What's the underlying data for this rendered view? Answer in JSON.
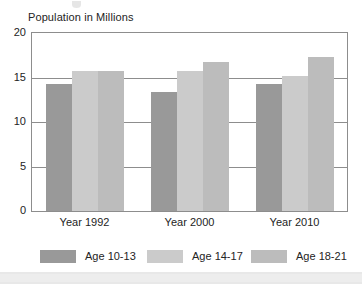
{
  "chart_data": {
    "type": "bar",
    "title": "Population in Millions",
    "xlabel": "",
    "ylabel": "",
    "categories": [
      "Year 1992",
      "Year 2000",
      "Year 2010"
    ],
    "series": [
      {
        "name": "Age 10-13",
        "values": [
          14.3,
          13.4,
          14.3
        ],
        "color": "#999999"
      },
      {
        "name": "Age 14-17",
        "values": [
          15.7,
          15.7,
          15.2
        ],
        "color": "#cbcbcb"
      },
      {
        "name": "Age 18-21",
        "values": [
          15.7,
          16.7,
          17.3
        ],
        "color": "#bcbcbc"
      }
    ],
    "ylim": [
      0,
      20
    ],
    "yticks": [
      0,
      5,
      10,
      15,
      20
    ],
    "ytick_labels": [
      "0",
      "5",
      "10",
      "15",
      "20"
    ],
    "grid": true,
    "legend_position": "bottom"
  },
  "legend": {
    "items": [
      {
        "label": "Age 10-13"
      },
      {
        "label": "Age 14-17"
      },
      {
        "label": "Age 18-21"
      }
    ]
  }
}
